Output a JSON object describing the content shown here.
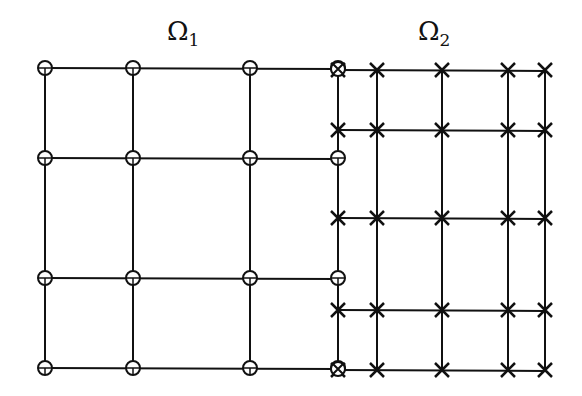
{
  "labels": {
    "omega1": {
      "symbol": "Ω",
      "subscript": "1",
      "x": 167,
      "y": 18
    },
    "omega2": {
      "symbol": "Ω",
      "subscript": "2",
      "x": 418,
      "y": 18
    }
  },
  "colors": {
    "ink": "#111111",
    "background": "#ffffff"
  },
  "grid1": {
    "name": "Ω1 coarse grid",
    "marker": "circle",
    "xs": [
      45,
      133,
      250,
      338
    ],
    "ys": [
      68,
      158,
      278,
      368
    ]
  },
  "grid2": {
    "name": "Ω2 fine grid",
    "marker": "cross",
    "xs": [
      338,
      377,
      442,
      508,
      545
    ],
    "ys": [
      70,
      130,
      218,
      310,
      370
    ]
  },
  "shared_points": [
    {
      "x": 338,
      "y": 69,
      "marker": "circle-cross"
    },
    {
      "x": 338,
      "y": 369,
      "marker": "circle-cross"
    }
  ]
}
